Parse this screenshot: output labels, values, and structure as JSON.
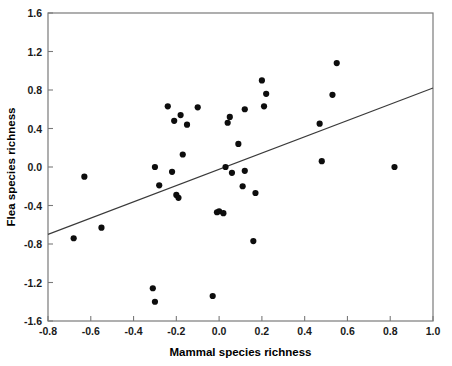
{
  "chart_data": {
    "type": "scatter",
    "title": "",
    "xlabel": "Mammal species richness",
    "ylabel": "Flea species richness",
    "xlim": [
      -0.8,
      1.0
    ],
    "ylim": [
      -1.6,
      1.6
    ],
    "xticks": [
      -0.8,
      -0.6,
      -0.4,
      -0.2,
      0.0,
      0.2,
      0.4,
      0.6,
      0.8,
      1.0
    ],
    "xticklabels": [
      "-0.8",
      "-0.6",
      "-0.4",
      "-0.2",
      "0.0",
      "0.2",
      "0.4",
      "0.6",
      "0.8",
      "1.0"
    ],
    "yticks": [
      1.6,
      1.2,
      0.8,
      0.4,
      0.0,
      -0.4,
      -0.8,
      -1.2,
      -1.6
    ],
    "yticklabels": [
      "1.6",
      "1.2",
      "0.8",
      "0.4",
      "0.0",
      "-0.4",
      "-0.8",
      "-1.2",
      "-1.6"
    ],
    "grid": false,
    "legend": null,
    "marker": "filled-circle",
    "marker_color": "#0d0d0d",
    "points": [
      {
        "x": -0.68,
        "y": -0.74
      },
      {
        "x": -0.63,
        "y": -0.1
      },
      {
        "x": -0.55,
        "y": -0.63
      },
      {
        "x": -0.31,
        "y": -1.26
      },
      {
        "x": -0.3,
        "y": 0.0
      },
      {
        "x": -0.3,
        "y": -1.4
      },
      {
        "x": -0.28,
        "y": -0.19
      },
      {
        "x": -0.24,
        "y": 0.63
      },
      {
        "x": -0.22,
        "y": -0.05
      },
      {
        "x": -0.21,
        "y": 0.48
      },
      {
        "x": -0.2,
        "y": -0.29
      },
      {
        "x": -0.19,
        "y": -0.32
      },
      {
        "x": -0.18,
        "y": 0.54
      },
      {
        "x": -0.17,
        "y": 0.13
      },
      {
        "x": -0.15,
        "y": 0.44
      },
      {
        "x": -0.1,
        "y": 0.62
      },
      {
        "x": -0.03,
        "y": -1.34
      },
      {
        "x": -0.01,
        "y": -0.47
      },
      {
        "x": 0.0,
        "y": -0.46
      },
      {
        "x": 0.02,
        "y": -0.48
      },
      {
        "x": 0.03,
        "y": 0.0
      },
      {
        "x": 0.04,
        "y": 0.46
      },
      {
        "x": 0.05,
        "y": 0.52
      },
      {
        "x": 0.06,
        "y": -0.06
      },
      {
        "x": 0.09,
        "y": 0.24
      },
      {
        "x": 0.11,
        "y": -0.2
      },
      {
        "x": 0.12,
        "y": 0.6
      },
      {
        "x": 0.12,
        "y": -0.04
      },
      {
        "x": 0.16,
        "y": -0.77
      },
      {
        "x": 0.17,
        "y": -0.27
      },
      {
        "x": 0.2,
        "y": 0.9
      },
      {
        "x": 0.21,
        "y": 0.63
      },
      {
        "x": 0.22,
        "y": 0.76
      },
      {
        "x": 0.47,
        "y": 0.45
      },
      {
        "x": 0.48,
        "y": 0.06
      },
      {
        "x": 0.53,
        "y": 0.75
      },
      {
        "x": 0.55,
        "y": 1.08
      },
      {
        "x": 0.82,
        "y": 0.0
      }
    ],
    "fit_line": {
      "type": "linear-regression",
      "x_start": -0.8,
      "y_start": -0.7,
      "x_end": 1.0,
      "y_end": 0.82,
      "color": "#3a3a3a"
    }
  }
}
